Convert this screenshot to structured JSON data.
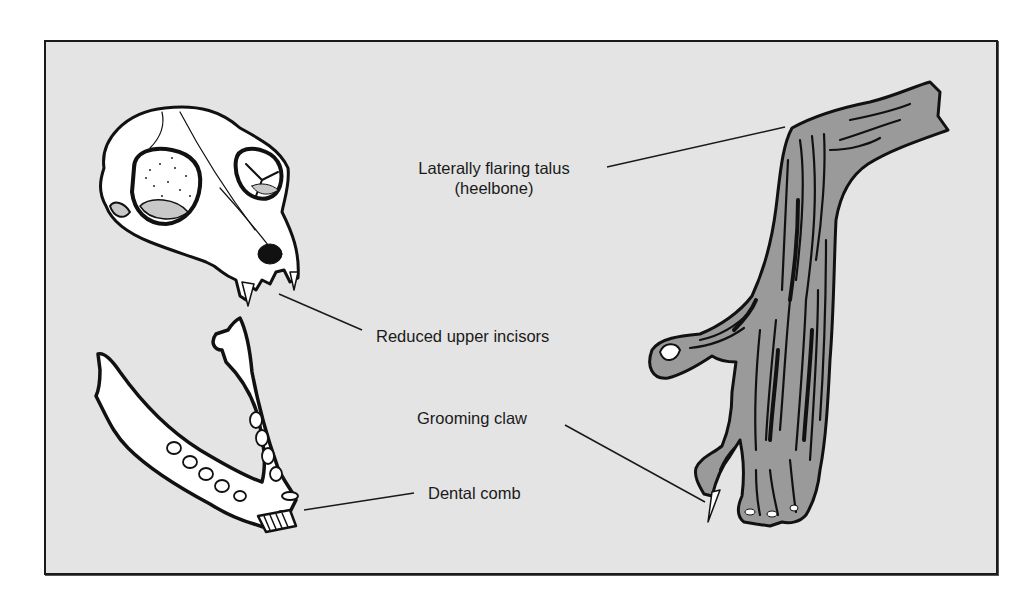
{
  "figure": {
    "background_color": "#e4e4e4",
    "border_color": "#1a1a1a",
    "foot_fill": "#9a9a9a",
    "bone_fill": "#ffffff",
    "ink": "#111111"
  },
  "labels": {
    "talus_line1": "Laterally flaring talus",
    "talus_line2": "(heelbone)",
    "incisors": "Reduced upper incisors",
    "grooming_claw": "Grooming claw",
    "dental_comb": "Dental comb"
  },
  "illustrations": {
    "skull": "prosimian-skull",
    "mandible": "prosimian-mandible",
    "foot": "prosimian-foot"
  }
}
